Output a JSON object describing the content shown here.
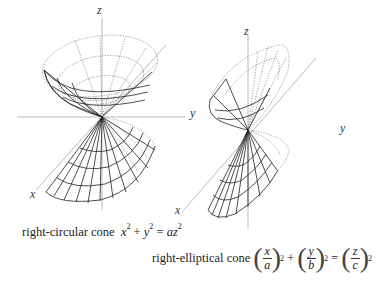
{
  "figures": [
    {
      "id": "right-circular",
      "axis_labels": {
        "z": "z",
        "y": "y",
        "x": "x"
      },
      "caption": {
        "name": "right-circular cone",
        "equation_parts": [
          "x",
          "2",
          "+",
          "y",
          "2",
          "=",
          "az",
          "2"
        ]
      }
    },
    {
      "id": "right-elliptical",
      "axis_labels": {
        "z": "z",
        "y": "y",
        "x": "x"
      },
      "caption": {
        "name": "right-elliptical cone",
        "terms": [
          {
            "num": "x",
            "den": "a",
            "exp": "2"
          },
          {
            "num": "y",
            "den": "b",
            "exp": "2"
          },
          {
            "num": "z",
            "den": "c",
            "exp": "2"
          }
        ],
        "plus": "+",
        "equals": "="
      }
    }
  ],
  "colors": {
    "axis": "#bbbbbb",
    "mesh": "#222222",
    "hidden": "#777777",
    "background": "#ffffff"
  }
}
